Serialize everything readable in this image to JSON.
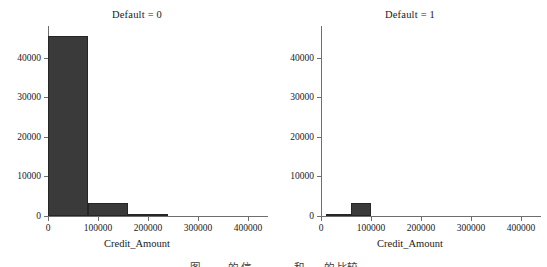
{
  "figure": {
    "background": "#ffffff",
    "bar_color": "#3a3a3a",
    "axis_color": "#6e6e6e",
    "caption_partial": "图 。 。 的 信 。。。 。。 和 。。 的 比较"
  },
  "chart_data": {
    "type": "bar",
    "title": "",
    "xlabel": "Credit_Amount",
    "ylabel": "",
    "grid": false,
    "legend": "none",
    "xlim": [
      0,
      440000
    ],
    "ylim": [
      0,
      48000
    ],
    "xticks": [
      0,
      100000,
      200000,
      300000,
      400000
    ],
    "xtick_labels": [
      "0",
      "100000",
      "200000",
      "300000",
      "400000"
    ],
    "yticks": [
      0,
      10000,
      20000,
      30000,
      40000
    ],
    "ytick_labels": [
      "0",
      "10000",
      "20000",
      "30000",
      "40000"
    ],
    "panels": [
      {
        "id": "default-0",
        "title": "Default = 0",
        "bins": [
          {
            "x0": 0,
            "x1": 80000,
            "value": 45500
          },
          {
            "x0": 80000,
            "x1": 160000,
            "value": 3300
          },
          {
            "x0": 160000,
            "x1": 240000,
            "value": 220
          }
        ]
      },
      {
        "id": "default-1",
        "title": "Default = 1",
        "bins": [
          {
            "x0": 10000,
            "x1": 60000,
            "value": 600
          },
          {
            "x0": 60000,
            "x1": 100000,
            "value": 3400
          }
        ]
      }
    ]
  }
}
